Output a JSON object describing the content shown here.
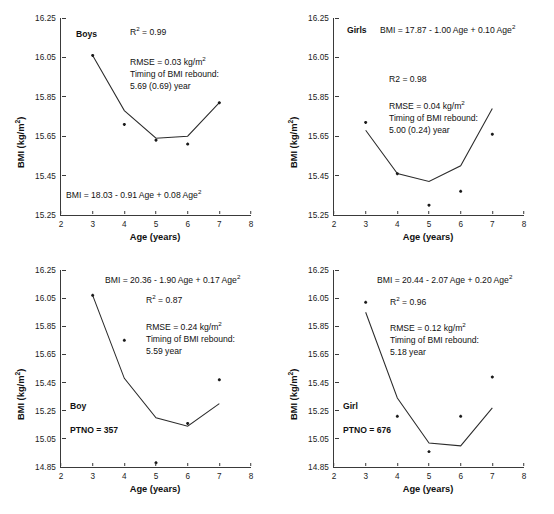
{
  "figure": {
    "axis_titles": {
      "x": "Age (years)",
      "y": "BMI (kg/m2)",
      "y_unit_base": "BMI (kg/m",
      "y_unit_sup": "2",
      "y_unit_tail": ")"
    },
    "x_ticks": [
      "2",
      "3",
      "4",
      "5",
      "6",
      "7",
      "8"
    ],
    "y_ticks_top": [
      "16.25",
      "16.05",
      "15.85",
      "15.65",
      "15.45",
      "15.25"
    ],
    "y_ticks_bottom": [
      "16.25",
      "16.05",
      "15.85",
      "15.65",
      "15.45",
      "15.25",
      "15.05",
      "14.85"
    ]
  },
  "panels": [
    {
      "id": "boys-top",
      "group_label": "Boys",
      "equation": "BMI = 18.03 - 0.91 Age + 0.08 Age",
      "equation_sup": "2",
      "r2_label": "R",
      "r2_sup": "2",
      "r2_value": "= 0.99",
      "rmse": "RMSE = 0.03 kg/m",
      "rmse_sup": "2",
      "rebound_label": "Timing of BMI rebound:",
      "rebound_value": "5.69 (0.69) year",
      "ptno": null
    },
    {
      "id": "girls-top",
      "group_label": "Girls",
      "equation": "BMI = 17.87 - 1.00 Age + 0.10 Age",
      "equation_sup": "2",
      "r2_label": "R2",
      "r2_sup": "",
      "r2_value": "= 0.98",
      "rmse": "RMSE = 0.04 kg/m",
      "rmse_sup": "2",
      "rebound_label": "Timing of BMI rebound:",
      "rebound_value": "5.00 (0.24) year",
      "ptno": null
    },
    {
      "id": "boy-bottom",
      "group_label": "Boy",
      "equation": "BMI = 20.36 - 1.90 Age + 0.17 Age",
      "equation_sup": "2",
      "r2_label": "R",
      "r2_sup": "2",
      "r2_value": "= 0.87",
      "rmse": "RMSE = 0.24 kg/m",
      "rmse_sup": "2",
      "rebound_label": "Timing of BMI rebound:",
      "rebound_value": "5.59 year",
      "ptno": "PTNO = 357"
    },
    {
      "id": "girl-bottom",
      "group_label": "Girl",
      "equation": "BMI = 20.44 - 2.07 Age + 0.20 Age",
      "equation_sup": "2",
      "r2_label": "R",
      "r2_sup": "2",
      "r2_value": "= 0.96",
      "rmse": "RMSE = 0.12 kg/m",
      "rmse_sup": "2",
      "rebound_label": "Timing of BMI rebound:",
      "rebound_value": "5.18 year",
      "ptno": "PTNO = 676"
    }
  ],
  "chart_data": [
    {
      "type": "scatter",
      "id": "boys-top",
      "title": "Boys",
      "xlabel": "Age (years)",
      "ylabel": "BMI (kg/m2)",
      "xlim": [
        2,
        8
      ],
      "ylim": [
        15.25,
        16.25
      ],
      "grid": false,
      "x": [
        3,
        4,
        5,
        6,
        7
      ],
      "observed": [
        16.06,
        15.71,
        15.63,
        15.61,
        15.82
      ],
      "fitted": [
        16.06,
        15.78,
        15.64,
        15.65,
        15.82
      ],
      "annotations": {
        "equation": "BMI = 18.03 - 0.91 Age + 0.08 Age^2",
        "R2": 0.99,
        "RMSE": 0.03,
        "timing_of_BMI_rebound_year": 5.69,
        "timing_SE": 0.69
      }
    },
    {
      "type": "scatter",
      "id": "girls-top",
      "title": "Girls",
      "xlabel": "Age (years)",
      "ylabel": "BMI (kg/m2)",
      "xlim": [
        2,
        8
      ],
      "ylim": [
        15.25,
        16.25
      ],
      "grid": false,
      "x": [
        3,
        4,
        5,
        6,
        7
      ],
      "observed": [
        15.72,
        15.46,
        15.3,
        15.37,
        15.66
      ],
      "fitted": [
        15.68,
        15.46,
        15.42,
        15.5,
        15.79
      ],
      "annotations": {
        "equation": "BMI = 17.87 - 1.00 Age + 0.10 Age^2",
        "R2": 0.98,
        "RMSE": 0.04,
        "timing_of_BMI_rebound_year": 5.0,
        "timing_SE": 0.24
      }
    },
    {
      "type": "scatter",
      "id": "boy-bottom",
      "title": "Boy",
      "xlabel": "Age (years)",
      "ylabel": "BMI (kg/m2)",
      "xlim": [
        2,
        8
      ],
      "ylim": [
        14.85,
        16.25
      ],
      "grid": false,
      "x": [
        3,
        4,
        5,
        6,
        7
      ],
      "observed": [
        16.07,
        15.75,
        14.88,
        15.16,
        15.47
      ],
      "fitted": [
        16.07,
        15.48,
        15.2,
        15.14,
        15.3
      ],
      "annotations": {
        "equation": "BMI = 20.36 - 1.90 Age + 0.17 Age^2",
        "R2": 0.87,
        "RMSE": 0.24,
        "timing_of_BMI_rebound_year": 5.59,
        "PTNO": 357
      }
    },
    {
      "type": "scatter",
      "id": "girl-bottom",
      "title": "Girl",
      "xlabel": "Age (years)",
      "ylabel": "BMI (kg/m2)",
      "xlim": [
        2,
        8
      ],
      "ylim": [
        14.85,
        16.25
      ],
      "grid": false,
      "x": [
        3,
        4,
        5,
        6,
        7
      ],
      "observed": [
        16.02,
        15.21,
        14.96,
        15.21,
        15.49
      ],
      "fitted": [
        15.95,
        15.34,
        15.02,
        15.0,
        15.27
      ],
      "annotations": {
        "equation": "BMI = 20.44 - 2.07 Age + 0.20 Age^2",
        "R2": 0.96,
        "RMSE": 0.12,
        "timing_of_BMI_rebound_year": 5.18,
        "PTNO": 676
      }
    }
  ]
}
